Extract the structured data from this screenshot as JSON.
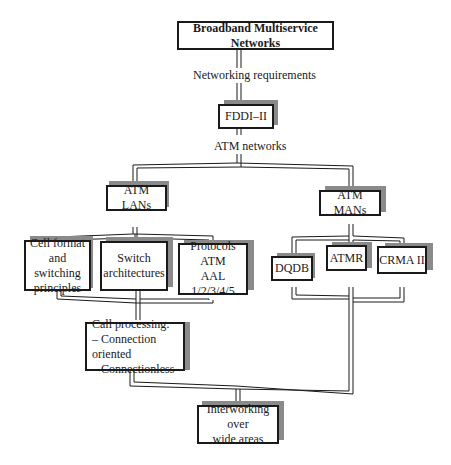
{
  "diagram": {
    "root": {
      "label": "Broadband Multiservice Networks"
    },
    "edge_labels": {
      "networking_requirements": "Networking requirements",
      "atm_networks": "ATM networks"
    },
    "nodes": {
      "fddi": {
        "label": "FDDI–II"
      },
      "atm_lans": {
        "label": "ATM LANs"
      },
      "atm_mans": {
        "label": "ATM MANs"
      },
      "cell_format": {
        "lines": [
          "Cell format",
          "and switching",
          "principles"
        ]
      },
      "switch_arch": {
        "lines": [
          "Switch",
          "architectures"
        ]
      },
      "protocols": {
        "lines": [
          "Protocols",
          "ATM",
          "AAL 1/2/3/4/5"
        ]
      },
      "dqdb": {
        "label": "DQDB"
      },
      "atmr": {
        "label": "ATMR"
      },
      "crma": {
        "label": "CRMA II"
      },
      "call_processing": {
        "lines": [
          "Call processing:",
          "– Connection oriented",
          "– Connectionless"
        ]
      },
      "interworking": {
        "lines": [
          "Interworking over",
          "wide areas"
        ]
      }
    },
    "style": {
      "line_color": "#1a1a1a",
      "shadow_color": "#8a8a8a",
      "background": "#ffffff"
    }
  }
}
